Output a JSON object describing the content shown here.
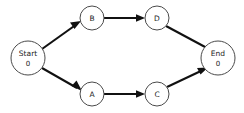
{
  "diagram": {
    "type": "activity-network-dag",
    "background_color": "#ffffff",
    "node_stroke_color": "#4a4a4a",
    "edge_color": "#111111",
    "text_color": "#222222",
    "nodes": [
      {
        "id": "start",
        "label": "Start",
        "value": "0",
        "cx": 28,
        "cy": 58,
        "r": 17,
        "kind": "terminal"
      },
      {
        "id": "b",
        "label": "B",
        "value": "",
        "cx": 92,
        "cy": 18,
        "r": 12,
        "kind": "task"
      },
      {
        "id": "d",
        "label": "D",
        "value": "",
        "cx": 157,
        "cy": 18,
        "r": 12,
        "kind": "task"
      },
      {
        "id": "a",
        "label": "A",
        "value": "",
        "cx": 92,
        "cy": 94,
        "r": 12,
        "kind": "task"
      },
      {
        "id": "c",
        "label": "C",
        "value": "",
        "cx": 157,
        "cy": 94,
        "r": 12,
        "kind": "task"
      },
      {
        "id": "end",
        "label": "End",
        "value": "0",
        "cx": 218,
        "cy": 58,
        "r": 17,
        "kind": "terminal"
      }
    ],
    "edges": [
      {
        "id": "start-b",
        "from": "Start",
        "to": "B",
        "label": "",
        "arrow": true
      },
      {
        "id": "b-d",
        "from": "B",
        "to": "D",
        "label": "",
        "arrow": true
      },
      {
        "id": "d-end",
        "from": "D",
        "to": "End",
        "label": "",
        "arrow": false
      },
      {
        "id": "start-a",
        "from": "Start",
        "to": "A",
        "label": "",
        "arrow": true
      },
      {
        "id": "a-c",
        "from": "A",
        "to": "C",
        "label": "",
        "arrow": true
      },
      {
        "id": "c-end",
        "from": "C",
        "to": "End",
        "label": "",
        "arrow": true
      }
    ]
  }
}
